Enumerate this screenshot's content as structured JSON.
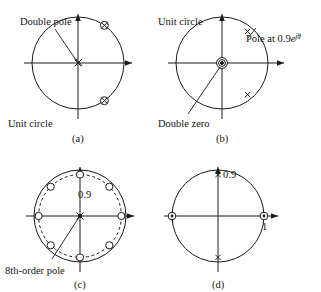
{
  "figure": {
    "name": "z-plane pole-zero diagrams",
    "panel_count": 4
  },
  "panels": {
    "a": {
      "caption": "(a)",
      "labels": {
        "double_pole": "Double pole",
        "unit_circle": "Unit circle"
      },
      "unit_circle_radius": 1,
      "markers": [
        {
          "type": "double-pole",
          "symbol": "x",
          "x": 0,
          "y": 0,
          "order": 2,
          "label": "Double pole"
        },
        {
          "type": "zero-pole-pair",
          "symbol": "circle-x",
          "radius": 1,
          "angle_deg": 55
        },
        {
          "type": "zero-pole-pair",
          "symbol": "circle-x",
          "radius": 1,
          "angle_deg": -55
        }
      ]
    },
    "b": {
      "caption": "(b)",
      "labels": {
        "unit_circle": "Unit circle",
        "double_zero": "Double zero",
        "pole_at_prefix": "Pole at ",
        "pole_at_value": "0.9",
        "pole_at_base": "e",
        "pole_at_exponent_j": "j",
        "pole_at_exponent_theta": "θ",
        "pole_at_full": "Pole at 0.9e^{jθ}"
      },
      "unit_circle_radius": 1,
      "markers": [
        {
          "type": "double-zero",
          "symbol": "double-circle",
          "x": 0,
          "y": 0,
          "order": 2,
          "label": "Double zero"
        },
        {
          "type": "pole",
          "symbol": "x",
          "radius": 0.9,
          "angle_deg": 55
        },
        {
          "type": "pole",
          "symbol": "x",
          "radius": 0.9,
          "angle_deg": -55
        }
      ]
    },
    "c": {
      "caption": "(c)",
      "labels": {
        "eighth_order_pole": "8th-order pole",
        "radius_value": "0.9"
      },
      "unit_circle_radius": 1,
      "dashed_circle_radius": 0.9,
      "zero_count": 8,
      "zero_angles_deg": [
        0,
        45,
        90,
        135,
        180,
        225,
        270,
        315
      ],
      "markers": [
        {
          "type": "pole",
          "symbol": "x",
          "x": 0,
          "y": 0,
          "order": 8,
          "label": "8th-order pole"
        },
        {
          "type": "zero",
          "symbol": "circle",
          "radius": 0.9,
          "angle_deg": 0
        },
        {
          "type": "zero",
          "symbol": "circle",
          "radius": 0.9,
          "angle_deg": 45
        },
        {
          "type": "zero",
          "symbol": "circle",
          "radius": 0.9,
          "angle_deg": 90
        },
        {
          "type": "zero",
          "symbol": "circle",
          "radius": 0.9,
          "angle_deg": 135
        },
        {
          "type": "zero",
          "symbol": "circle",
          "radius": 0.9,
          "angle_deg": 180
        },
        {
          "type": "zero",
          "symbol": "circle",
          "radius": 0.9,
          "angle_deg": 225
        },
        {
          "type": "zero",
          "symbol": "circle",
          "radius": 0.9,
          "angle_deg": 270
        },
        {
          "type": "zero",
          "symbol": "circle",
          "radius": 0.9,
          "angle_deg": 315
        }
      ]
    },
    "d": {
      "caption": "(d)",
      "labels": {
        "pole_radius": "0.9",
        "zero_radius": "1"
      },
      "unit_circle_radius": 1,
      "markers": [
        {
          "type": "zero",
          "symbol": "circle-dot",
          "x": -1,
          "y": 0
        },
        {
          "type": "zero",
          "symbol": "circle-dot",
          "x": 1,
          "y": 0,
          "label": "1"
        },
        {
          "type": "pole",
          "symbol": "x",
          "x": 0,
          "y": 0.9,
          "label": "0.9"
        },
        {
          "type": "pole",
          "symbol": "x",
          "x": 0,
          "y": -0.9
        }
      ]
    }
  },
  "colors": {
    "ink": "#1a1a1a",
    "background": "#ffffff"
  }
}
